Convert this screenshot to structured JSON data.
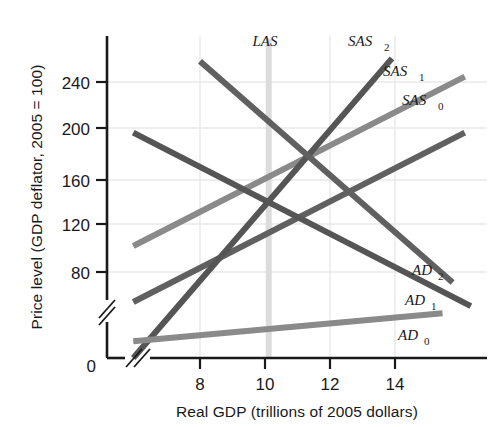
{
  "chart_data": {
    "type": "line",
    "title": "",
    "xlabel": "Real GDP (trillions of 2005 dollars)",
    "ylabel": "Price level (GDP deflator, 2005 = 100)",
    "xlim": [
      6,
      15.4
    ],
    "ylim": [
      40,
      270
    ],
    "xticks": [
      8,
      10,
      12,
      14
    ],
    "xtick_labels": [
      "8",
      "10",
      "12",
      "14"
    ],
    "yticks": [
      80,
      120,
      160,
      200,
      240
    ],
    "ytick_labels": [
      "80",
      "120",
      "160",
      "200",
      "240"
    ],
    "origin_label": "0",
    "grid": true,
    "grid_color": "#e8e8e8",
    "axis_break_x": true,
    "axis_break_y": true,
    "legend": "inline-end-labels",
    "note": "AS-AD model: three aggregate demand curves, three short-run aggregate supply curves, one long-run aggregate supply line. All curves intersect near (10, 160).",
    "series": [
      {
        "name": "LAS",
        "label": "LAS",
        "label_base": "LAS",
        "label_sub": "",
        "kind": "vertical-band",
        "x": 10,
        "y_start": 50,
        "y_end": 268,
        "color": "#dcdcdc",
        "width_px": 6,
        "label_x": 10,
        "label_y": 262
      },
      {
        "name": "SAS0",
        "label": "SAS₀",
        "label_base": "SAS",
        "label_sub": "0",
        "kind": "upward",
        "points": [
          [
            6.65,
            120
          ],
          [
            14.85,
            241
          ]
        ],
        "color": "#8a8a8a",
        "width_px": 6,
        "label_x": 13.45,
        "label_y": 248
      },
      {
        "name": "SAS1",
        "label": "SAS₁",
        "label_base": "SAS",
        "label_sub": "1",
        "kind": "upward",
        "points": [
          [
            6.65,
            80
          ],
          [
            14.85,
            201
          ]
        ],
        "color": "#606060",
        "width_px": 6,
        "label_x": 13.5,
        "label_y": 268
      },
      {
        "name": "SAS2",
        "label": "SAS₂",
        "label_base": "SAS",
        "label_sub": "2",
        "kind": "upward",
        "points": [
          [
            6.65,
            40
          ],
          [
            13.05,
            254
          ]
        ],
        "color": "#555555",
        "width_px": 6,
        "label_x": 11.9,
        "label_y": 263
      },
      {
        "name": "AD0",
        "label": "AD₀",
        "label_base": "AD",
        "label_sub": "0",
        "kind": "downward",
        "points": [
          [
            6.65,
            52
          ],
          [
            14.3,
            72
          ]
        ],
        "color": "#8a8a8a",
        "width_px": 6,
        "label_x": 14.1,
        "label_y": 62
      },
      {
        "name": "AD1",
        "label": "AD₁",
        "label_base": "AD",
        "label_sub": "1",
        "kind": "downward",
        "points": [
          [
            8.3,
            252
          ],
          [
            14.55,
            94
          ]
        ],
        "color": "#606060",
        "width_px": 6,
        "label_x": 14.2,
        "label_y": 86
      },
      {
        "name": "AD2",
        "label": "AD₂",
        "label_base": "AD",
        "label_sub": "2",
        "kind": "downward",
        "points": [
          [
            6.65,
            201
          ],
          [
            15.0,
            77
          ]
        ],
        "color": "#555555",
        "width_px": 6,
        "label_x": 14.25,
        "label_y": 110
      }
    ]
  },
  "axes": {
    "x_title": "Real GDP (trillions of 2005 dollars)",
    "y_title": "Price level (GDP deflator, 2005 = 100)",
    "origin": "0",
    "x_tick_0": "8",
    "x_tick_1": "10",
    "x_tick_2": "12",
    "x_tick_3": "14",
    "y_tick_0": "80",
    "y_tick_1": "120",
    "y_tick_2": "160",
    "y_tick_3": "200",
    "y_tick_4": "240"
  },
  "curve_labels": {
    "las": "LAS",
    "sas0_base": "SAS",
    "sas0_sub": "0",
    "sas1_base": "SAS",
    "sas1_sub": "1",
    "sas2_base": "SAS",
    "sas2_sub": "2",
    "ad0_base": "AD",
    "ad0_sub": "0",
    "ad1_base": "AD",
    "ad1_sub": "1",
    "ad2_base": "AD",
    "ad2_sub": "2"
  },
  "colors": {
    "dark": "#555555",
    "mid": "#606060",
    "light": "#8a8a8a",
    "las_band": "#dcdcdc",
    "grid": "#e8e8e8",
    "axis": "#1a1a1a",
    "text": "#1a1a1a",
    "background": "#ffffff"
  }
}
